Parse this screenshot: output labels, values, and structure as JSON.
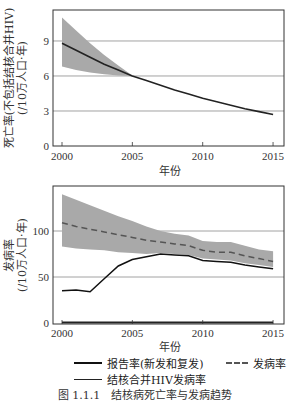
{
  "chart_data": [
    {
      "type": "line",
      "title": "",
      "xlabel": "年份",
      "ylabel": "死亡率(不包括结核合并HIV)",
      "ylabel_unit": "(/10万人口·年)",
      "x": [
        2000,
        2001,
        2002,
        2003,
        2004,
        2005,
        2006,
        2007,
        2008,
        2009,
        2010,
        2011,
        2012,
        2013,
        2014,
        2015
      ],
      "series": [
        {
          "name": "死亡率",
          "values": [
            8.8,
            8.2,
            7.6,
            7.0,
            6.5,
            6.0,
            5.6,
            5.2,
            4.8,
            4.45,
            4.1,
            3.8,
            3.5,
            3.2,
            2.95,
            2.7
          ]
        }
      ],
      "uncertainty_band": {
        "upper": [
          11.0,
          9.9,
          8.8,
          7.8,
          6.9,
          6.05
        ],
        "lower": [
          6.8,
          6.5,
          6.3,
          6.15,
          6.05,
          6.0
        ],
        "x": [
          2000,
          2001,
          2002,
          2003,
          2004,
          2005
        ]
      },
      "xticks": [
        "2000",
        "2005",
        "2010",
        "2015"
      ],
      "yticks": [
        "0",
        "3",
        "6",
        "9"
      ],
      "ylim": [
        0,
        11.5
      ],
      "xlim": [
        1999.4,
        2015.8
      ],
      "grid": "horizontal"
    },
    {
      "type": "line",
      "title": "",
      "xlabel": "年份",
      "ylabel": "发病率",
      "ylabel_unit": "(/10万人口·年)",
      "x": [
        2000,
        2001,
        2002,
        2003,
        2004,
        2005,
        2006,
        2007,
        2008,
        2009,
        2010,
        2011,
        2012,
        2013,
        2014,
        2015
      ],
      "series": [
        {
          "name": "报告率(新发和复发)",
          "style": "solid",
          "values": [
            35,
            36,
            34,
            48,
            62,
            69,
            72,
            75,
            74,
            73,
            68,
            67,
            66,
            63,
            61,
            59
          ]
        },
        {
          "name": "发病率",
          "style": "dashed",
          "values": [
            109,
            105,
            102,
            99,
            96,
            93,
            90,
            88,
            86,
            84,
            79,
            77,
            77,
            73,
            70,
            67
          ]
        },
        {
          "name": "结核合并HIV发病率",
          "style": "thin",
          "values": [
            0.5,
            0.5,
            0.5,
            0.5,
            0.5,
            0.5,
            0.5,
            0.5,
            0.5,
            0.5,
            0.5,
            0.5,
            0.5,
            0.5,
            0.5,
            0.5
          ]
        }
      ],
      "uncertainty_band": {
        "upper": [
          140,
          134,
          128,
          122,
          116,
          111,
          105,
          100,
          97,
          95,
          89,
          88,
          88,
          84,
          80,
          78
        ],
        "lower": [
          83,
          81,
          80,
          79,
          77,
          76,
          75,
          76,
          75,
          74,
          70,
          69,
          68,
          65,
          63,
          61
        ]
      },
      "xticks": [
        "2000",
        "2005",
        "2010",
        "2015"
      ],
      "yticks": [
        "0",
        "50",
        "100"
      ],
      "ylim": [
        0,
        150
      ],
      "xlim": [
        1999.4,
        2015.8
      ],
      "grid": "horizontal"
    }
  ],
  "axis": {
    "xlabel": "年份",
    "top_ylabel_line1": "死亡率(不包括结核合并HIV)",
    "top_ylabel_line2": "(/10万人口·年)",
    "bottom_ylabel_line1": "发病率",
    "bottom_ylabel_line2": "(/10万人口·年)",
    "xticks": [
      "2000",
      "2005",
      "2010",
      "2015"
    ],
    "top_yticks": [
      "0",
      "3",
      "6",
      "9"
    ],
    "bottom_yticks": [
      "0",
      "50",
      "100"
    ]
  },
  "legend": {
    "reported": "报告率(新发和复发)",
    "incidence": "发病率",
    "tbhiv": "结核合并HIV发病率"
  },
  "caption": "图 1.1.1　结核病死亡率与发病趋势",
  "colors": {
    "band": "#a9a9a9",
    "line": "#222222",
    "dashed": "#555555",
    "grid": "#888888"
  }
}
